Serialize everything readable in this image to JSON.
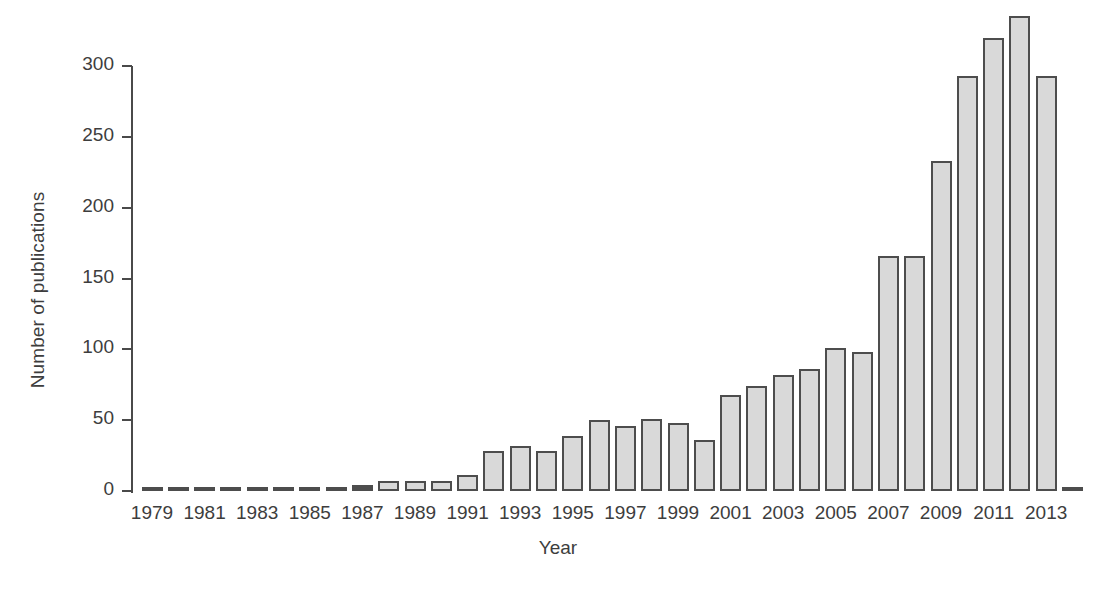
{
  "chart_data": {
    "type": "bar",
    "title": "",
    "xlabel": "Year",
    "ylabel": "Number of publications",
    "ylim": [
      0,
      340
    ],
    "yticks": [
      0,
      50,
      100,
      150,
      200,
      250,
      300
    ],
    "xtick_labels": [
      "1979",
      "1981",
      "1983",
      "1985",
      "1987",
      "1989",
      "1991",
      "1993",
      "1995",
      "1997",
      "1999",
      "2001",
      "2003",
      "2005",
      "2007",
      "2009",
      "2011",
      "2013"
    ],
    "grid": false,
    "legend": null,
    "bar_fill_color": "#d9d9d9",
    "bar_edge_color": "#4d4d4d",
    "axis_color": "#4a4a4a",
    "text_color": "#3d3d3d",
    "categories": [
      "1979",
      "1980",
      "1981",
      "1982",
      "1983",
      "1984",
      "1985",
      "1986",
      "1987",
      "1988",
      "1989",
      "1990",
      "1991",
      "1992",
      "1993",
      "1994",
      "1995",
      "1996",
      "1997",
      "1998",
      "1999",
      "2000",
      "2001",
      "2002",
      "2003",
      "2004",
      "2005",
      "2006",
      "2007",
      "2008",
      "2009",
      "2010",
      "2011",
      "2012",
      "2013",
      "2014"
    ],
    "values": [
      1,
      0,
      0,
      1,
      1,
      1,
      1,
      3,
      4,
      7,
      7,
      7,
      11,
      28,
      32,
      28,
      39,
      50,
      46,
      51,
      48,
      36,
      68,
      74,
      82,
      86,
      101,
      98,
      166,
      166,
      233,
      293,
      320,
      335,
      293,
      1
    ]
  }
}
